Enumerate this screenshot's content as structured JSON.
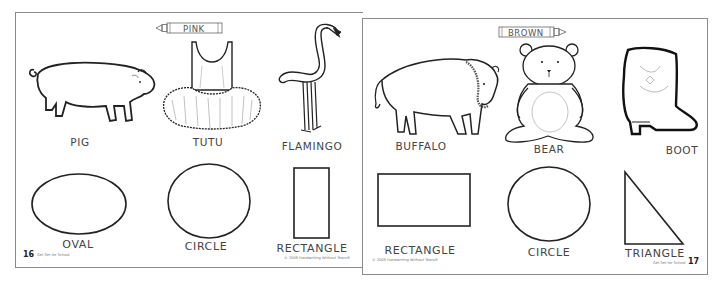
{
  "spread": {
    "left_page": {
      "page_number": "16",
      "crayon_color_label": "PINK",
      "footer_series": "Get Set for School",
      "footer_copyright": "© 2008 Handwriting Without Tears®",
      "pictures": [
        {
          "label": "PIG",
          "icon": "pig-drawing"
        },
        {
          "label": "TUTU",
          "icon": "tutu-drawing"
        },
        {
          "label": "FLAMINGO",
          "icon": "flamingo-drawing"
        }
      ],
      "shapes": [
        {
          "label": "OVAL",
          "icon": "oval-shape"
        },
        {
          "label": "CIRCLE",
          "icon": "circle-shape"
        },
        {
          "label": "RECTANGLE",
          "icon": "tall-rectangle-shape"
        }
      ]
    },
    "right_page": {
      "page_number": "17",
      "crayon_color_label": "BROWN",
      "footer_series": "Get Set for School",
      "footer_copyright": "© 2008 Handwriting Without Tears®",
      "pictures": [
        {
          "label": "BUFFALO",
          "icon": "buffalo-drawing"
        },
        {
          "label": "BEAR",
          "icon": "teddy-bear-drawing"
        },
        {
          "label": "BOOT",
          "icon": "cowboy-boot-drawing"
        }
      ],
      "shapes": [
        {
          "label": "RECTANGLE",
          "icon": "wide-rectangle-shape"
        },
        {
          "label": "CIRCLE",
          "icon": "circle-shape"
        },
        {
          "label": "TRIANGLE",
          "icon": "right-triangle-shape"
        }
      ]
    },
    "colors": {
      "line": "#222222",
      "border": "#8a8a8a",
      "paper": "#ffffff"
    }
  }
}
